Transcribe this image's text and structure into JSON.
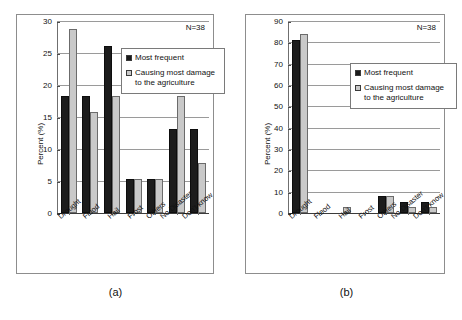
{
  "figure": {
    "panels": [
      {
        "caption": "(a)",
        "annotation": "N=38",
        "ylabel": "Percent (%)",
        "yticks": [
          "0",
          "5",
          "10",
          "15",
          "20",
          "25",
          "30"
        ],
        "legend": [
          {
            "label": "Most frequent",
            "style": "dark"
          },
          {
            "label": "Causing most damage to the agriculture",
            "style": "light"
          }
        ]
      },
      {
        "caption": "(b)",
        "annotation": "N=38",
        "ylabel": "Percent (%)",
        "yticks": [
          "0",
          "10",
          "20",
          "30",
          "40",
          "50",
          "60",
          "70",
          "80",
          "90"
        ],
        "legend": [
          {
            "label": "Most frequent",
            "style": "dark"
          },
          {
            "label": "Causing most damage to the agriculture",
            "style": "light"
          }
        ]
      }
    ]
  },
  "chart_data": [
    {
      "type": "bar",
      "title": "(a)",
      "xlabel": "",
      "ylabel": "Percent (%)",
      "ylim": [
        0,
        30
      ],
      "ytick_step": 5,
      "grid": true,
      "legend_position": "upper-right-inside",
      "annotation": "N=38",
      "categories": [
        "Drought",
        "Flood",
        "Hail",
        "Frost",
        "Others",
        "No Disaster",
        "Don't know"
      ],
      "series": [
        {
          "name": "Most frequent",
          "color": "#1c1c1c",
          "values": [
            18.4,
            18.4,
            26.3,
            5.3,
            5.3,
            13.2,
            13.2
          ]
        },
        {
          "name": "Causing most damage to the agriculture",
          "color": "#c9c9c9",
          "values": [
            28.9,
            15.8,
            18.4,
            5.3,
            5.3,
            18.4,
            7.9
          ]
        }
      ]
    },
    {
      "type": "bar",
      "title": "(b)",
      "xlabel": "",
      "ylabel": "Percent (%)",
      "ylim": [
        0,
        90
      ],
      "ytick_step": 10,
      "grid": true,
      "legend_position": "upper-right-inside",
      "annotation": "N=38",
      "categories": [
        "Drought",
        "Flood",
        "Hail",
        "Frost",
        "Others",
        "No Disaster",
        "Don't know"
      ],
      "series": [
        {
          "name": "Most frequent",
          "color": "#1c1c1c",
          "values": [
            81.6,
            0,
            0,
            0,
            7.9,
            5.3,
            5.3
          ]
        },
        {
          "name": "Causing most damage to the agriculture",
          "color": "#c9c9c9",
          "values": [
            84.2,
            0,
            2.6,
            0,
            7.9,
            2.6,
            2.6
          ]
        }
      ]
    }
  ]
}
